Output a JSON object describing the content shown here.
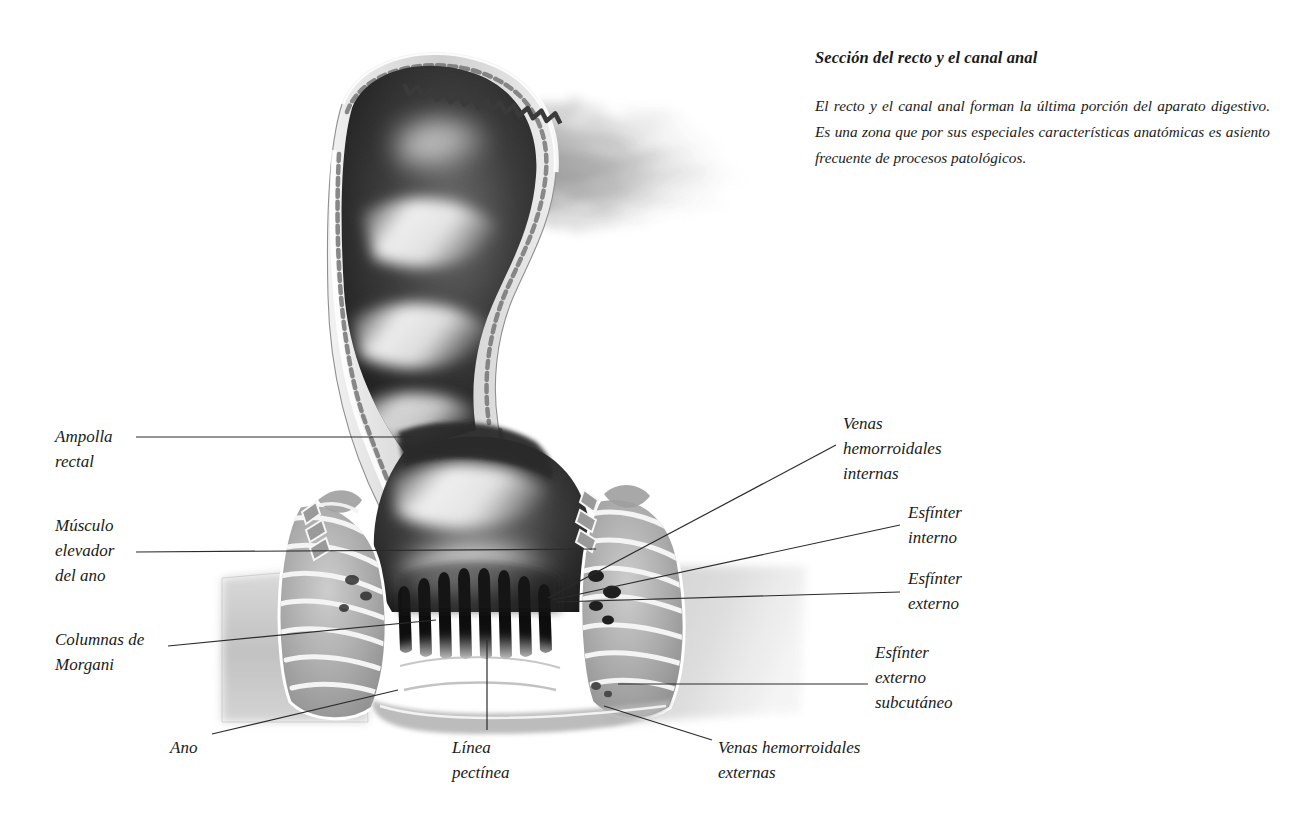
{
  "page": {
    "title": "Sección del recto y el canal anal",
    "description": "El recto y el canal anal forman la última porción del aparato digestivo. Es una zona que por sus especiales características anatómicas es asiento frecuente de procesos patológicos.",
    "background_color": "#ffffff",
    "text_color": "#1a1a1a"
  },
  "figure": {
    "type": "anatomical-illustration",
    "style": "airbrush grayscale medical illustration",
    "labels": [
      {
        "id": "ampolla-rectal",
        "text": "Ampolla\nrectal",
        "side": "left",
        "x": 55,
        "y": 424
      },
      {
        "id": "musculo-elevador",
        "text": "Músculo\nelevador\ndel ano",
        "side": "left",
        "x": 55,
        "y": 513
      },
      {
        "id": "columnas-morgani",
        "text": "Columnas de\nMorgani",
        "side": "left",
        "x": 55,
        "y": 627
      },
      {
        "id": "ano",
        "text": "Ano",
        "side": "bottom",
        "x": 170,
        "y": 735
      },
      {
        "id": "linea-pectinea",
        "text": "Línea\npectínea",
        "side": "bottom",
        "x": 452,
        "y": 735
      },
      {
        "id": "venas-hem-externas",
        "text": "Venas hemorroidales\nexternas",
        "side": "bottom",
        "x": 718,
        "y": 735
      },
      {
        "id": "venas-hem-internas",
        "text": "Venas\nhemorroidales\ninternas",
        "side": "right",
        "x": 843,
        "y": 411
      },
      {
        "id": "esfinter-interno",
        "text": "Esfínter\ninterno",
        "side": "right",
        "x": 908,
        "y": 500
      },
      {
        "id": "esfinter-externo",
        "text": "Esfínter\nexterno",
        "side": "right",
        "x": 908,
        "y": 566
      },
      {
        "id": "esfinter-ext-subcut",
        "text": "Esfínter\nexterno\nsubcutáneo",
        "side": "right",
        "x": 875,
        "y": 640
      }
    ]
  }
}
